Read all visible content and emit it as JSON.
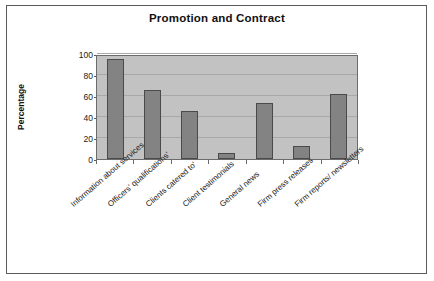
{
  "chart_data": {
    "type": "bar",
    "title": "Promotion and Contract",
    "xlabel": "",
    "ylabel": "Percentage",
    "categories": [
      "Information about services",
      "Officers' qualifications'",
      "Clients catered to'",
      "Client testimonials",
      "General news",
      "Firm press releases",
      "Firm reports/ newsletters"
    ],
    "values": [
      95,
      66,
      46,
      6,
      53,
      12,
      62
    ],
    "ylim": [
      0,
      100
    ],
    "yticks": [
      0,
      20,
      40,
      60,
      80,
      100
    ],
    "ytick_labels": [
      "0",
      "20",
      "40",
      "60",
      "80",
      "100"
    ],
    "grid": true,
    "legend": false,
    "series_color": "#838383",
    "plot_background": "#c2c2c2",
    "figure_background": "#ffffff",
    "border_color": "#5a5a5a"
  }
}
